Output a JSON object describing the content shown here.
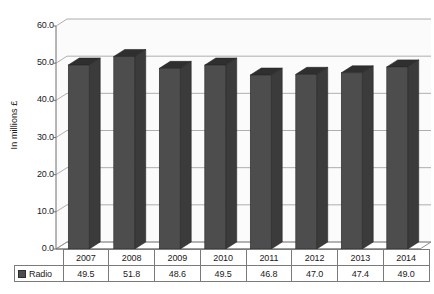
{
  "chart_data": {
    "type": "bar",
    "title": "",
    "xlabel": "",
    "ylabel": "In millions £",
    "categories": [
      "2007",
      "2008",
      "2009",
      "2010",
      "2011",
      "2012",
      "2013",
      "2014"
    ],
    "series": [
      {
        "name": "Radio",
        "values": [
          49.5,
          51.8,
          48.6,
          49.5,
          46.8,
          47.0,
          47.4,
          49.0
        ],
        "color": "#4d4d4d"
      }
    ],
    "ylim": [
      0.0,
      60.0
    ],
    "ytick_step": 10.0,
    "ytick_labels": [
      "0.0",
      "10.0",
      "20.0",
      "30.0",
      "40.0",
      "50.0",
      "60.0"
    ],
    "grid": true,
    "grid_axis": "y",
    "legend_position": "table-row-header",
    "three_d": true,
    "data_table_visible": true
  },
  "axis": {
    "y_title": "In millions £"
  },
  "table": {
    "series_label": "Radio",
    "value_labels": [
      "49.5",
      "51.8",
      "48.6",
      "49.5",
      "46.8",
      "47.0",
      "47.4",
      "49.0"
    ],
    "year_labels": [
      "2007",
      "2008",
      "2009",
      "2010",
      "2011",
      "2012",
      "2013",
      "2014"
    ]
  },
  "colors": {
    "bar_front": "#4d4d4d",
    "bar_top": "#2f2f2f",
    "bar_side": "#3b3b3b",
    "grid": "#9a9a9a",
    "axis": "#6e6e6e",
    "plot_bg": "#fbfbfb",
    "text": "#1a1a1a",
    "table_border": "#7a7a7a"
  }
}
